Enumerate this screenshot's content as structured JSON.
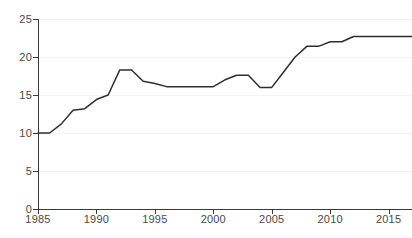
{
  "chart_data": {
    "type": "line",
    "title": "",
    "subtitle": "",
    "xlabel": "",
    "ylabel": "",
    "xlim": [
      1985,
      2017
    ],
    "ylim": [
      0,
      25
    ],
    "grid": true,
    "legend": false,
    "legend_position": "none",
    "line_color": "#2f2f2f",
    "gridline_color": "#f4f2f2",
    "axis_color": "#3a3a3a",
    "tick_label_color": "#4a4a4a",
    "y_ticks": [
      0,
      5,
      10,
      15,
      20,
      25
    ],
    "y_tick_labels": [
      "0",
      "5",
      "10",
      "15",
      "20",
      "25"
    ],
    "x_ticks": [
      1985,
      1990,
      1995,
      2000,
      2005,
      2010,
      2015
    ],
    "x_tick_labels": [
      "1985",
      "1990",
      "1995",
      "2000",
      "2005",
      "2010",
      "2015"
    ],
    "x": [
      1985,
      1986,
      1987,
      1988,
      1989,
      1990,
      1991,
      1992,
      1993,
      1994,
      1995,
      1996,
      1997,
      1998,
      1999,
      2000,
      2001,
      2002,
      2003,
      2004,
      2005,
      2006,
      2007,
      2008,
      2009,
      2010,
      2011,
      2012,
      2013,
      2014,
      2015,
      2016,
      2017
    ],
    "values": [
      10.0,
      10.0,
      11.2,
      13.0,
      13.2,
      14.4,
      15.0,
      18.3,
      18.3,
      16.8,
      16.5,
      16.1,
      16.1,
      16.1,
      16.1,
      16.1,
      17.0,
      17.6,
      17.6,
      16.0,
      16.0,
      18.0,
      20.0,
      21.4,
      21.4,
      22.0,
      22.0,
      22.7,
      22.7,
      22.7,
      22.7,
      22.7,
      22.7
    ],
    "series": [
      {
        "name": "series-1",
        "values": [
          10.0,
          10.0,
          11.2,
          13.0,
          13.2,
          14.4,
          15.0,
          18.3,
          18.3,
          16.8,
          16.5,
          16.1,
          16.1,
          16.1,
          16.1,
          16.1,
          17.0,
          17.6,
          17.6,
          16.0,
          16.0,
          18.0,
          20.0,
          21.4,
          21.4,
          22.0,
          22.0,
          22.7,
          22.7,
          22.7,
          22.7,
          22.7,
          22.7
        ]
      }
    ]
  }
}
